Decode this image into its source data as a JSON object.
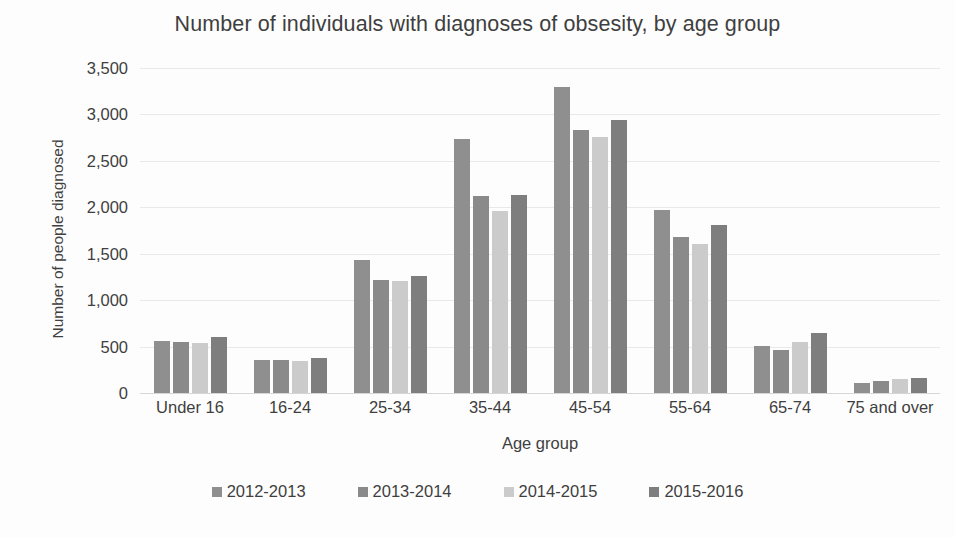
{
  "chart_data": {
    "type": "bar",
    "title": "Number of individuals with diagnoses of obsesity, by age group",
    "xlabel": "Age group",
    "ylabel": "Number of people diagnosed",
    "categories": [
      "Under 16",
      "16-24",
      "25-34",
      "35-44",
      "45-54",
      "55-64",
      "65-74",
      "75 and over"
    ],
    "series": [
      {
        "name": "2012-2013",
        "color": "#8f8f8f",
        "values": [
          560,
          355,
          1430,
          2740,
          3300,
          1975,
          510,
          110
        ]
      },
      {
        "name": "2013-2014",
        "color": "#8a8a8a",
        "values": [
          545,
          360,
          1215,
          2125,
          2830,
          1685,
          465,
          130
        ]
      },
      {
        "name": "2014-2015",
        "color": "#cbcbcb",
        "values": [
          540,
          350,
          1205,
          1955,
          2755,
          1605,
          550,
          150
        ]
      },
      {
        "name": "2015-2016",
        "color": "#7e7e7e",
        "values": [
          600,
          380,
          1260,
          2135,
          2940,
          1805,
          645,
          165
        ]
      }
    ],
    "ylim": [
      0,
      3500
    ],
    "yticks": [
      0,
      500,
      1000,
      1500,
      2000,
      2500,
      3000,
      3500
    ],
    "ytick_labels": [
      "0",
      "500",
      "1,000",
      "1,500",
      "2,000",
      "2,500",
      "3,000",
      "3,500"
    ],
    "grid": true,
    "legend_position": "bottom"
  }
}
